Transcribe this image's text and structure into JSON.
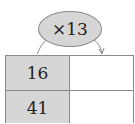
{
  "multiplier": {
    "label": "×13",
    "operation": "multiply",
    "factor": 13
  },
  "table": {
    "rows": [
      {
        "left": "16",
        "right": ""
      },
      {
        "left": "41",
        "right": ""
      }
    ]
  },
  "colors": {
    "shaded": "#d6d6d6",
    "border": "#8a8a8a",
    "text": "#222222"
  }
}
